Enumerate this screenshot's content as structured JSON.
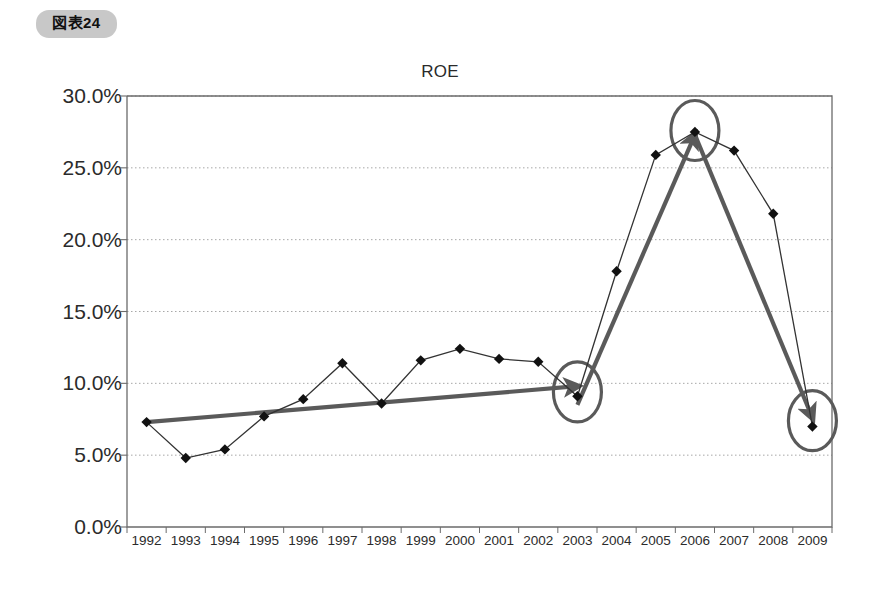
{
  "figure": {
    "badge_label": "図表24"
  },
  "chart_data": {
    "type": "line",
    "title": "ROE",
    "xlabel": "",
    "ylabel": "",
    "grid": true,
    "legend": false,
    "ylim": [
      0,
      30
    ],
    "ytick_labels": [
      "0.0%",
      "5.0%",
      "10.0%",
      "15.0%",
      "20.0%",
      "25.0%",
      "30.0%"
    ],
    "yticks": [
      0,
      5,
      10,
      15,
      20,
      25,
      30
    ],
    "categories": [
      "1992",
      "1993",
      "1994",
      "1995",
      "1996",
      "1997",
      "1998",
      "1999",
      "2000",
      "2001",
      "2002",
      "2003",
      "2004",
      "2005",
      "2006",
      "2007",
      "2008",
      "2009"
    ],
    "series": [
      {
        "name": "ROE",
        "values": [
          7.3,
          4.8,
          5.4,
          7.7,
          8.9,
          11.4,
          8.6,
          11.6,
          12.4,
          11.7,
          11.5,
          9.1,
          17.8,
          25.9,
          27.5,
          26.2,
          21.8,
          7.0
        ]
      }
    ],
    "annotations": [
      {
        "name": "trend-arrow-1992-2003",
        "type": "arrow",
        "from": {
          "x": "1992",
          "y": 7.3
        },
        "to": {
          "x": "2003",
          "y": 9.8
        },
        "color": "#5a5a5a"
      },
      {
        "name": "trend-arrow-2003-2006",
        "type": "arrow",
        "from": {
          "x": "2003",
          "y": 8.5
        },
        "to": {
          "x": "2006",
          "y": 27.3
        },
        "color": "#5a5a5a"
      },
      {
        "name": "trend-arrow-2006-2009",
        "type": "arrow",
        "from": {
          "x": "2006",
          "y": 27.3
        },
        "to": {
          "x": "2009",
          "y": 7.6
        },
        "color": "#5a5a5a"
      },
      {
        "name": "highlight-circle-2003",
        "type": "ellipse",
        "at": {
          "x": "2003",
          "y": 9.4
        },
        "color": "#5a5a5a"
      },
      {
        "name": "highlight-circle-2006",
        "type": "ellipse",
        "at": {
          "x": "2006",
          "y": 27.6
        },
        "color": "#5a5a5a"
      },
      {
        "name": "highlight-circle-2009",
        "type": "ellipse",
        "at": {
          "x": "2009",
          "y": 7.4
        },
        "color": "#5a5a5a"
      }
    ],
    "colors": {
      "line": "#333333",
      "marker": "#111111",
      "grid": "#a8a8a8",
      "axis": "#6b6b6b",
      "annotation": "#5a5a5a",
      "badge_background": "#c8c8c8"
    }
  }
}
